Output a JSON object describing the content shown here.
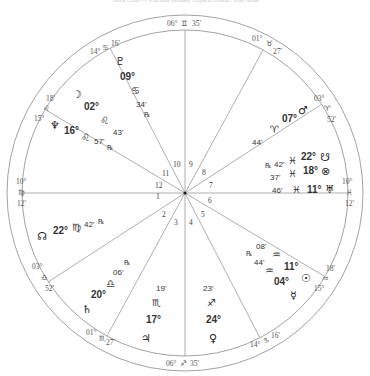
{
  "caption": "Natal Chart — Placidus Houses, Tropical Zodiac, True Node",
  "colors": {
    "lines": "#999999",
    "text": "#333333",
    "ring": "#888888"
  },
  "geometry": {
    "cx": 185,
    "cy": 193,
    "outer_r": 178,
    "inner_r": 163
  },
  "house_cusps": [
    {
      "house": 10,
      "deg": "06°",
      "sign": "♊",
      "min": "35'",
      "label": "MC"
    },
    {
      "house": 11,
      "deg": "14°",
      "sign": "♋",
      "min": "16'"
    },
    {
      "house": 12,
      "deg": "15°",
      "sign": "♌",
      "min": "18'"
    },
    {
      "house": 1,
      "deg": "10°",
      "sign": "♍",
      "min": "12'",
      "label": "ASC"
    },
    {
      "house": 2,
      "deg": "03°",
      "sign": "♎",
      "min": "52'"
    },
    {
      "house": 3,
      "deg": "01°",
      "sign": "♏",
      "min": "27'"
    },
    {
      "house": 4,
      "deg": "06°",
      "sign": "♐",
      "min": "35'",
      "label": "IC"
    },
    {
      "house": 5,
      "deg": "14°",
      "sign": "♑",
      "min": "16'"
    },
    {
      "house": 6,
      "deg": "15°",
      "sign": "♒",
      "min": "18'"
    },
    {
      "house": 7,
      "deg": "10°",
      "sign": "♓",
      "min": "12'",
      "label": "DSC"
    },
    {
      "house": 8,
      "deg": "03°",
      "sign": "♈",
      "min": "52'"
    },
    {
      "house": 9,
      "deg": "01°",
      "sign": "♉",
      "min": "27'"
    }
  ],
  "house_numbers": [
    "1",
    "2",
    "3",
    "4",
    "5",
    "6",
    "7",
    "8",
    "9",
    "10",
    "11",
    "12"
  ],
  "planets": [
    {
      "name": "Pluto",
      "symbol": "♇",
      "deg": "09°",
      "sign": "♋",
      "min": "34'",
      "retro": "℞"
    },
    {
      "name": "Moon",
      "symbol": "☽",
      "deg": "02°",
      "sign": "♌",
      "min": "43'",
      "retro": ""
    },
    {
      "name": "Neptune",
      "symbol": "♆",
      "deg": "16°",
      "sign": "♌",
      "min": "57'",
      "retro": "℞"
    },
    {
      "name": "North Node",
      "symbol": "☊",
      "deg": "22°",
      "sign": "♍",
      "min": "42'",
      "retro": "℞"
    },
    {
      "name": "Mars",
      "symbol": "♂",
      "deg": "07°",
      "sign": "♈",
      "min": "44'",
      "retro": ""
    },
    {
      "name": "Lilith",
      "symbol": "☋",
      "deg": "22°",
      "sign": "♓",
      "min": "42'",
      "retro": "℞"
    },
    {
      "name": "Part of Fortune",
      "symbol": "⊗",
      "deg": "18°",
      "sign": "♓",
      "min": "37'",
      "retro": ""
    },
    {
      "name": "Uranus",
      "symbol": "♅",
      "deg": "11°",
      "sign": "♓",
      "min": "46'",
      "retro": ""
    },
    {
      "name": "Sun",
      "symbol": "☉",
      "deg": "11°",
      "sign": "♒",
      "min": "08'",
      "retro": ""
    },
    {
      "name": "Mercury",
      "symbol": "☿",
      "deg": "04°",
      "sign": "♒",
      "min": "44'",
      "retro": "℞"
    },
    {
      "name": "Venus",
      "symbol": "♀",
      "deg": "24°",
      "sign": "♐",
      "min": "23'",
      "retro": ""
    },
    {
      "name": "Jupiter",
      "symbol": "♃",
      "deg": "17°",
      "sign": "♏",
      "min": "19'",
      "retro": ""
    },
    {
      "name": "Saturn",
      "symbol": "♄",
      "deg": "20°",
      "sign": "♎",
      "min": "06'",
      "retro": "℞"
    }
  ]
}
